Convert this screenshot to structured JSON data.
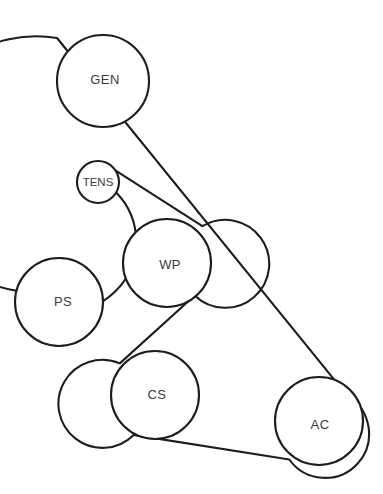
{
  "diagram": {
    "type": "serpentine-belt-routing",
    "background_color": "#ffffff",
    "line_color": "#1d1d1d",
    "label_color": "#3a3a3a",
    "canvas": {
      "width": 383,
      "height": 494
    }
  },
  "pulleys": [
    {
      "id": "gen",
      "label": "GEN",
      "cx": 103,
      "cy": 81,
      "r": 46,
      "label_x": 105,
      "label_y": 79,
      "size": "normal"
    },
    {
      "id": "tens",
      "label": "TENS",
      "cx": 98,
      "cy": 182,
      "r": 21,
      "label_x": 98,
      "label_y": 182,
      "size": "small"
    },
    {
      "id": "ps",
      "label": "PS",
      "cx": 59,
      "cy": 302,
      "r": 44,
      "label_x": 63,
      "label_y": 301,
      "size": "normal"
    },
    {
      "id": "wp",
      "label": "WP",
      "cx": 167,
      "cy": 263,
      "r": 44,
      "label_x": 170,
      "label_y": 264,
      "size": "normal"
    },
    {
      "id": "cs",
      "label": "CS",
      "cx": 155,
      "cy": 395,
      "r": 44,
      "label_x": 157,
      "label_y": 394,
      "size": "normal"
    },
    {
      "id": "ac",
      "label": "AC",
      "cx": 319,
      "cy": 421,
      "r": 44,
      "label_x": 320,
      "label_y": 424,
      "size": "normal"
    }
  ],
  "belt": {
    "description": "Continuous belt wrapping GEN, AC, CS, WP, TENS and PS pulleys",
    "segments": [
      {
        "from": "gen",
        "to": "ac",
        "side": "outer-right"
      },
      {
        "from": "ac",
        "to": "cs",
        "side": "outer-bottom"
      },
      {
        "from": "cs",
        "to": "wp",
        "side": "crossed"
      },
      {
        "from": "wp",
        "to": "tens",
        "side": "crossed-upper"
      },
      {
        "from": "tens",
        "to": "ps",
        "side": "inner-left"
      },
      {
        "from": "ps",
        "to": "gen",
        "side": "outer-left"
      }
    ],
    "path_d": "M 57.0 38.0 A 46 46 0 1 0 15.4 290.5 A 44 44 0 1 0 116.2 192.4 A 21 21 0 0 1 116.1 170.9 L 202.4 226.2 A 44 44 0 1 1 194.7 295.5 L 119.8 363.4 A 44 44 0 1 0 133.6 434.9 L 289.3 459.5 A 44 44 0 1 0 347.6 396.1 Z"
  }
}
